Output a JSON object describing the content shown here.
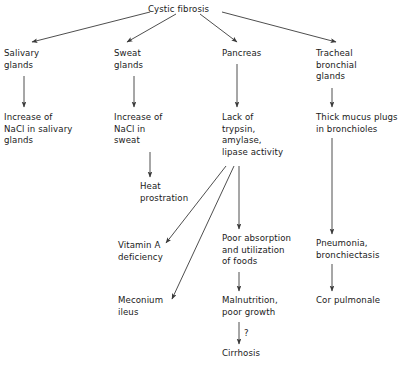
{
  "diagram": {
    "line_color": "#3a3a3a",
    "text_color": "#1a1a1a",
    "background_color": "#ffffff",
    "nodes": [
      {
        "id": "cystic_fibrosis",
        "label": "Cystic fibrosis",
        "x": 148,
        "y": 4,
        "align": "left"
      },
      {
        "id": "salivary_glands",
        "label": "Salivary\nglands",
        "x": 4,
        "y": 48,
        "align": "left"
      },
      {
        "id": "sweat_glands",
        "label": "Sweat\nglands",
        "x": 114,
        "y": 48,
        "align": "left"
      },
      {
        "id": "pancreas",
        "label": "Pancreas",
        "x": 222,
        "y": 48,
        "align": "left"
      },
      {
        "id": "tracheal_bronchial_glands",
        "label": "Tracheal\nbronchial\nglands",
        "x": 316,
        "y": 48,
        "align": "left"
      },
      {
        "id": "increase_nacl_salivary",
        "label": "Increase of\nNaCl in salivary\nglands",
        "x": 4,
        "y": 112,
        "align": "left"
      },
      {
        "id": "increase_nacl_sweat",
        "label": "Increase of\nNaCl in\nsweat",
        "x": 114,
        "y": 112,
        "align": "left"
      },
      {
        "id": "lack_of_enzymes",
        "label": "Lack of\ntrypsin,\namylase,\nlipase activity",
        "x": 222,
        "y": 112,
        "align": "left"
      },
      {
        "id": "thick_mucus_plugs",
        "label": "Thick mucus plugs\nin bronchioles",
        "x": 316,
        "y": 112,
        "align": "left"
      },
      {
        "id": "heat_prostration",
        "label": "Heat\nprostration",
        "x": 140,
        "y": 181,
        "align": "left"
      },
      {
        "id": "vitamin_a_deficiency",
        "label": "Vitamin A\ndeficiency",
        "x": 118,
        "y": 240,
        "align": "left"
      },
      {
        "id": "poor_absorption",
        "label": "Poor absorption\nand utilization\nof foods",
        "x": 222,
        "y": 233,
        "align": "left"
      },
      {
        "id": "pneumonia_bronchiectasis",
        "label": "Pneumonia,\nbronchiectasis",
        "x": 316,
        "y": 238,
        "align": "left"
      },
      {
        "id": "meconium_ileus",
        "label": "Meconium\nileus",
        "x": 118,
        "y": 295,
        "align": "left"
      },
      {
        "id": "malnutrition",
        "label": "Malnutrition,\npoor growth",
        "x": 222,
        "y": 295,
        "align": "left"
      },
      {
        "id": "cor_pulmonale",
        "label": "Cor pulmonale",
        "x": 316,
        "y": 295,
        "align": "left"
      },
      {
        "id": "cirrhosis",
        "label": "Cirrhosis",
        "x": 222,
        "y": 348,
        "align": "left"
      }
    ],
    "edges": [
      {
        "id": "cf-to-salivary",
        "from": "cystic_fibrosis",
        "to": "salivary_glands",
        "x1": 150,
        "y1": 12,
        "x2": 32,
        "y2": 42
      },
      {
        "id": "cf-to-sweat",
        "from": "cystic_fibrosis",
        "to": "sweat_glands",
        "x1": 176,
        "y1": 14,
        "x2": 127,
        "y2": 42
      },
      {
        "id": "cf-to-pancreas",
        "from": "cystic_fibrosis",
        "to": "pancreas",
        "x1": 200,
        "y1": 14,
        "x2": 237,
        "y2": 42
      },
      {
        "id": "cf-to-tracheal",
        "from": "cystic_fibrosis",
        "to": "tracheal_bronchial_glands",
        "x1": 222,
        "y1": 12,
        "x2": 336,
        "y2": 42
      },
      {
        "id": "salivary-to-nacl",
        "from": "salivary_glands",
        "to": "increase_nacl_salivary",
        "x1": 24,
        "y1": 76,
        "x2": 24,
        "y2": 107
      },
      {
        "id": "sweat-to-nacl",
        "from": "sweat_glands",
        "to": "increase_nacl_sweat",
        "x1": 134,
        "y1": 76,
        "x2": 134,
        "y2": 107
      },
      {
        "id": "pancreas-to-lack",
        "from": "pancreas",
        "to": "lack_of_enzymes",
        "x1": 237,
        "y1": 64,
        "x2": 237,
        "y2": 107
      },
      {
        "id": "tracheal-to-mucus",
        "from": "tracheal_bronchial_glands",
        "to": "thick_mucus_plugs",
        "x1": 332,
        "y1": 88,
        "x2": 332,
        "y2": 107
      },
      {
        "id": "nacl-sweat-to-heat",
        "from": "increase_nacl_sweat",
        "to": "heat_prostration",
        "x1": 150,
        "y1": 152,
        "x2": 150,
        "y2": 177
      },
      {
        "id": "lack-to-vitamin-a",
        "from": "lack_of_enzymes",
        "to": "vitamin_a_deficiency",
        "x1": 226,
        "y1": 166,
        "x2": 166,
        "y2": 243
      },
      {
        "id": "lack-to-meconium",
        "from": "lack_of_enzymes",
        "to": "meconium_ileus",
        "x1": 234,
        "y1": 166,
        "x2": 172,
        "y2": 299
      },
      {
        "id": "lack-to-poor-absorption",
        "from": "lack_of_enzymes",
        "to": "poor_absorption",
        "x1": 239,
        "y1": 166,
        "x2": 239,
        "y2": 229
      },
      {
        "id": "mucus-to-pneumonia",
        "from": "thick_mucus_plugs",
        "to": "pneumonia_bronchiectasis",
        "x1": 332,
        "y1": 138,
        "x2": 332,
        "y2": 234
      },
      {
        "id": "poor-absorption-to-malnutrition",
        "from": "poor_absorption",
        "to": "malnutrition",
        "x1": 239,
        "y1": 272,
        "x2": 239,
        "y2": 291
      },
      {
        "id": "pneumonia-to-cor-pulmonale",
        "from": "pneumonia_bronchiectasis",
        "to": "cor_pulmonale",
        "x1": 332,
        "y1": 264,
        "x2": 332,
        "y2": 291
      },
      {
        "id": "malnutrition-to-cirrhosis",
        "from": "malnutrition",
        "to": "cirrhosis",
        "x1": 239,
        "y1": 322,
        "x2": 239,
        "y2": 344,
        "label": "?"
      }
    ],
    "edge_labels": [
      {
        "id": "question-mark",
        "text": "?",
        "x": 244,
        "y": 328
      }
    ]
  }
}
